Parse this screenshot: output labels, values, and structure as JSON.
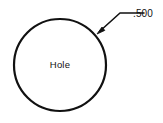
{
  "drawing": {
    "title": "Hole feature with leader dimension",
    "background_color": "#ffffff",
    "line_color": "#111111",
    "shape": {
      "name": "circle",
      "label": "Hole",
      "center_x": 60,
      "center_y": 65,
      "radius": 46,
      "stroke_width": 2.2
    },
    "leader": {
      "label": ".500",
      "arrow_tip_x": 97,
      "arrow_tip_y": 34,
      "bend_x": 120,
      "bend_y": 13,
      "end_x": 144,
      "end_y": 13,
      "stroke_width": 1.6
    },
    "dimension_label": {
      "value": ".500",
      "x": 133,
      "y": 17
    }
  }
}
